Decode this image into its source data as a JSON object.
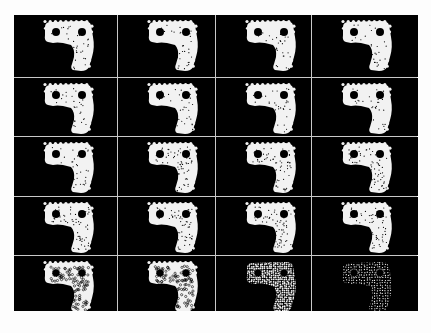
{
  "figure": {
    "layout": {
      "rows": 5,
      "cols": 4
    },
    "background_color": "#000000",
    "shape_color": "#f2f2f2",
    "grid_line_color": "#c8c8c8",
    "cells": [
      {
        "row": 1,
        "col": 1,
        "style": "solid"
      },
      {
        "row": 1,
        "col": 2,
        "style": "solid"
      },
      {
        "row": 1,
        "col": 3,
        "style": "solid"
      },
      {
        "row": 1,
        "col": 4,
        "style": "solid"
      },
      {
        "row": 2,
        "col": 1,
        "style": "solid"
      },
      {
        "row": 2,
        "col": 2,
        "style": "solid"
      },
      {
        "row": 2,
        "col": 3,
        "style": "solid"
      },
      {
        "row": 2,
        "col": 4,
        "style": "solid"
      },
      {
        "row": 3,
        "col": 1,
        "style": "solid"
      },
      {
        "row": 3,
        "col": 2,
        "style": "speckled"
      },
      {
        "row": 3,
        "col": 3,
        "style": "speckled"
      },
      {
        "row": 3,
        "col": 4,
        "style": "speckled"
      },
      {
        "row": 4,
        "col": 1,
        "style": "speckled"
      },
      {
        "row": 4,
        "col": 2,
        "style": "speckled"
      },
      {
        "row": 4,
        "col": 3,
        "style": "speckled"
      },
      {
        "row": 4,
        "col": 4,
        "style": "speckled"
      },
      {
        "row": 5,
        "col": 1,
        "style": "bubbly"
      },
      {
        "row": 5,
        "col": 2,
        "style": "bubbly"
      },
      {
        "row": 5,
        "col": 3,
        "style": "dotted"
      },
      {
        "row": 5,
        "col": 4,
        "style": "sparse-dots"
      }
    ]
  }
}
